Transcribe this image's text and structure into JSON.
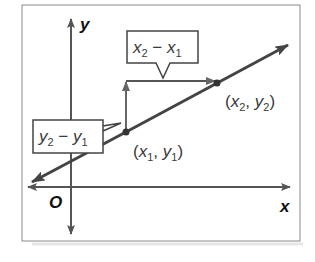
{
  "diagram": {
    "axes": {
      "x_label": "x",
      "y_label": "y",
      "origin_label": "O"
    },
    "points": [
      {
        "name": "point-1",
        "var_x": "x",
        "sub_x": "1",
        "var_y": "y",
        "sub_y": "1",
        "open": "(",
        "comma": ", ",
        "close": ")"
      },
      {
        "name": "point-2",
        "var_x": "x",
        "sub_x": "2",
        "var_y": "y",
        "sub_y": "2",
        "open": "(",
        "comma": ", ",
        "close": ")"
      }
    ],
    "callouts": {
      "run": {
        "a": "x",
        "a_sub": "2",
        "op": " − ",
        "b": "x",
        "b_sub": "1"
      },
      "rise": {
        "a": "y",
        "a_sub": "2",
        "op": " − ",
        "b": "y",
        "b_sub": "1"
      }
    },
    "colors": {
      "line": "#444444",
      "axis": "#555555",
      "box_border": "#444444",
      "frame": "#888888",
      "text": "#3a3a3a"
    }
  }
}
